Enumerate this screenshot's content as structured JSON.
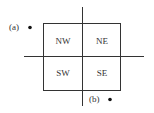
{
  "diagram": {
    "quadrants": [
      {
        "id": "nw",
        "label": "NW"
      },
      {
        "id": "ne",
        "label": "NE"
      },
      {
        "id": "sw",
        "label": "SW"
      },
      {
        "id": "se",
        "label": "SE"
      }
    ],
    "points": [
      {
        "id": "a",
        "label": "(a)"
      },
      {
        "id": "b",
        "label": "(b)"
      }
    ],
    "colors": {
      "ink": "#333333",
      "dot": "#111111",
      "background": "#ffffff"
    }
  }
}
